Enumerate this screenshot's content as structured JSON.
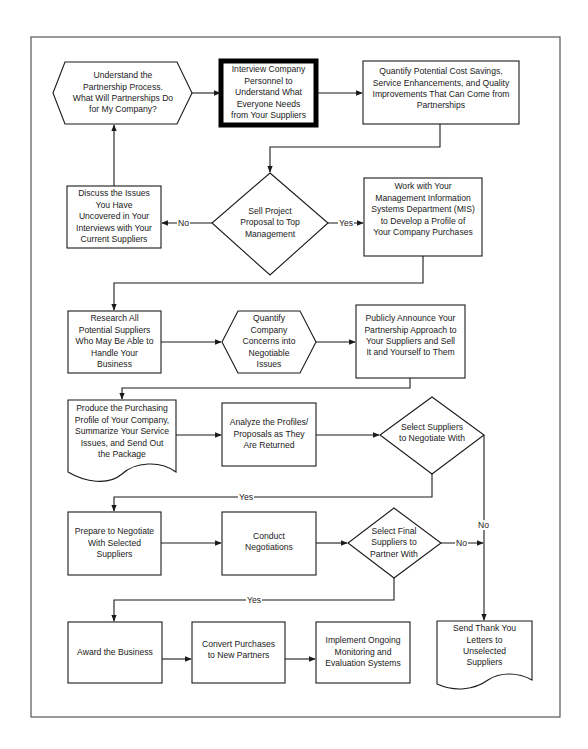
{
  "diagram": {
    "type": "flowchart",
    "colors": {
      "line": "#1a1a1a",
      "frame": "#555555",
      "background": "#ffffff",
      "highlight_border": "#000000"
    },
    "nodes": [
      {
        "id": "n1",
        "shape": "hexagon",
        "text": "Understand the\nPartnership Process.\nWhat Will Partnerships Do\nfor My Company?"
      },
      {
        "id": "n2",
        "shape": "box-highlighted",
        "text": "Interview Company\nPersonnel  to\nUnderstand What\nEveryone Needs\nfrom Your Suppliers"
      },
      {
        "id": "n3",
        "shape": "box",
        "text": "Quantify Potential Cost Savings,\nService Enhancements, and Quality\nImprovements That Can Come from\nPartnerships"
      },
      {
        "id": "n4",
        "shape": "diamond",
        "text": "Sell Project\nProposal to Top\nManagement"
      },
      {
        "id": "n5",
        "shape": "box",
        "text": "Discuss the Issues\nYou Have\nUncovered in Your\nInterviews with Your\nCurrent Suppliers"
      },
      {
        "id": "n6",
        "shape": "box",
        "text": "Work with Your\nManagement Information\nSystems Department (MIS)\nto Develop a Profile of\nYour Company Purchases"
      },
      {
        "id": "n7",
        "shape": "box",
        "text": "Research All\nPotential Suppliers\nWho May Be Able to\nHandle Your\nBusiness"
      },
      {
        "id": "n8",
        "shape": "hexagon",
        "text": "Quantify\nCompany\nConcerns into\nNegotiable\nIssues"
      },
      {
        "id": "n9",
        "shape": "box",
        "text": "Publicly Announce Your\nPartnership Approach to\nYour Suppliers and Sell\nIt and Yourself to Them"
      },
      {
        "id": "n10",
        "shape": "document",
        "text": "Produce the Purchasing\nProfile of Your Company,\nSummarize Your Service\nIssues, and Send Out\nthe Package"
      },
      {
        "id": "n11",
        "shape": "box",
        "text": "Analyze the Profiles/\nProposals as They\nAre Returned"
      },
      {
        "id": "n12",
        "shape": "diamond",
        "text": "Select Suppliers\nto Negotiate With"
      },
      {
        "id": "n13",
        "shape": "box",
        "text": "Prepare to Negotiate\nWith Selected\nSuppliers"
      },
      {
        "id": "n14",
        "shape": "box",
        "text": "Conduct\nNegotiations"
      },
      {
        "id": "n15",
        "shape": "diamond",
        "text": "Select Final\nSuppliers to\nPartner With"
      },
      {
        "id": "n16",
        "shape": "box",
        "text": "Award the Business"
      },
      {
        "id": "n17",
        "shape": "box",
        "text": "Convert Purchases\nto New Partners"
      },
      {
        "id": "n18",
        "shape": "box",
        "text": "Implement Ongoing\nMonitoring and\nEvaluation Systems"
      },
      {
        "id": "n19",
        "shape": "document",
        "text": "Send Thank You\nLetters to\nUnselected\nSuppliers"
      }
    ],
    "edges": [
      {
        "from": "n1",
        "to": "n2",
        "label": ""
      },
      {
        "from": "n2",
        "to": "n3",
        "label": ""
      },
      {
        "from": "n3",
        "to": "n4",
        "label": ""
      },
      {
        "from": "n4",
        "to": "n5",
        "label": "No"
      },
      {
        "from": "n4",
        "to": "n6",
        "label": "Yes"
      },
      {
        "from": "n5",
        "to": "n1",
        "label": ""
      },
      {
        "from": "n6",
        "to": "n7",
        "label": ""
      },
      {
        "from": "n7",
        "to": "n8",
        "label": ""
      },
      {
        "from": "n8",
        "to": "n9",
        "label": ""
      },
      {
        "from": "n9",
        "to": "n10",
        "label": ""
      },
      {
        "from": "n10",
        "to": "n11",
        "label": ""
      },
      {
        "from": "n11",
        "to": "n12",
        "label": ""
      },
      {
        "from": "n12",
        "to": "n13",
        "label": "Yes"
      },
      {
        "from": "n12",
        "to": "n19",
        "label": "No"
      },
      {
        "from": "n13",
        "to": "n14",
        "label": ""
      },
      {
        "from": "n14",
        "to": "n15",
        "label": ""
      },
      {
        "from": "n15",
        "to": "n16",
        "label": "Yes"
      },
      {
        "from": "n15",
        "to": "n19",
        "label": "No"
      },
      {
        "from": "n16",
        "to": "n17",
        "label": ""
      },
      {
        "from": "n17",
        "to": "n18",
        "label": ""
      }
    ],
    "edge_labels": {
      "e4_no": "No",
      "e4_yes": "Yes",
      "e12_yes": "Yes",
      "e12_no": "No",
      "e15_no": "No",
      "e15_yes": "Yes"
    }
  }
}
